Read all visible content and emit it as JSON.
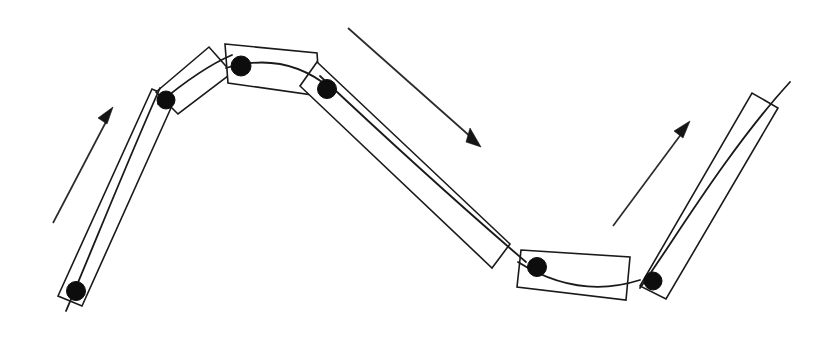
{
  "figure": {
    "background_color": "#ffffff",
    "line_color": "#1a1a1a",
    "joint_color": "#0d0d0d",
    "arrow_color": "#151515",
    "canvas": {
      "width": 837,
      "height": 341
    }
  },
  "joints": [
    {
      "name": "joint-1",
      "x": 76,
      "y": 291,
      "r": 9.5
    },
    {
      "name": "joint-2",
      "x": 166,
      "y": 100,
      "r": 9.0
    },
    {
      "name": "joint-3",
      "x": 241,
      "y": 66,
      "r": 10.0
    },
    {
      "name": "joint-4",
      "x": 327,
      "y": 89,
      "r": 9.5
    },
    {
      "name": "joint-5",
      "x": 537,
      "y": 267,
      "r": 9.5
    },
    {
      "name": "joint-6",
      "x": 653,
      "y": 281,
      "r": 9.0
    }
  ],
  "links": [
    {
      "name": "link-1-lower-left-riser",
      "outline": "M 58,296 L 152,89 L 175,99 L 82,306 Z",
      "spine": "M 66,311 C 92,250 130,155 160,88"
    },
    {
      "name": "link-2-left-shoulder",
      "outline": "M 156,92 L 209,47 L 232,73 L 178,114 Z",
      "spine": "M 158,104 C 182,84 206,66 232,55"
    },
    {
      "name": "link-3-crest",
      "outline": "M 225,44 L 317,53 L 320,96 L 228,83 Z",
      "spine": "M 226,68 C 260,58 296,60 330,88"
    },
    {
      "name": "link-4-long-descender",
      "outline": "M 317,62 L 510,244 L 492,268 L 300,86 Z",
      "spine": "M 320,76 C 386,138 456,202 526,262"
    },
    {
      "name": "link-5-trough",
      "outline": "M 521,250 L 630,257 L 626,300 L 517,287 Z",
      "spine": "M 518,262 C 556,286 596,294 640,280"
    },
    {
      "name": "link-6-right-riser",
      "outline": "M 640,286 L 752,93 L 778,108 L 666,299 Z",
      "spine": "M 640,288 C 668,250 726,152 790,82"
    }
  ],
  "arrows": [
    {
      "name": "arrow-left-up",
      "shaft": "M 53,223 L 108,118",
      "head": "M 113,107 L 98,118 L 107,124 Z",
      "direction": "up-right"
    },
    {
      "name": "arrow-middle-down",
      "shaft": "M 348,28 L 472,138",
      "head": "M 481,147 L 466,142 L 470,128 Z",
      "direction": "down-right"
    },
    {
      "name": "arrow-right-up",
      "shaft": "M 613,226 L 682,133",
      "head": "M 690,121 L 674,131 L 683,138 Z",
      "direction": "up-right"
    }
  ]
}
